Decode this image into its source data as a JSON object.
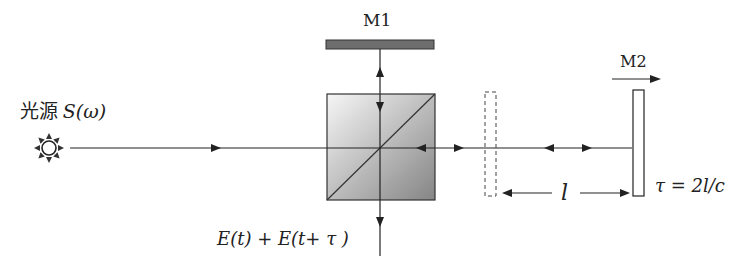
{
  "diagram": {
    "type": "Michelson interferometer",
    "source_label_cjk": "光源",
    "source_label_func": "S(ω)",
    "mirror1_label": "M1",
    "mirror2_label": "M2",
    "output_label": "E(t) + E(t+ τ )",
    "length_label": "l",
    "delay_formula": "τ = 2l/c",
    "colors": {
      "line": "#222222",
      "mirror1_fill": "#6e6e6e",
      "splitter_gradient_start": "#f4f4f4",
      "splitter_gradient_end": "#8a8a8a"
    }
  }
}
